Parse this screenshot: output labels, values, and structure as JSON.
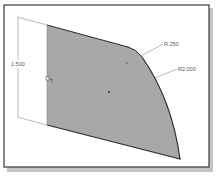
{
  "drawing": {
    "type": "CAD sketch",
    "dimensions": {
      "vertical_height": "1.500",
      "small_radius": "R.250",
      "large_radius": "R2.000"
    },
    "colors": {
      "background": "#ffffff",
      "frame": "#3a3a3a",
      "frame_shadow": "#b8b8b8",
      "region_fill": "#a8a8a8",
      "outline": "#2a2a2a",
      "dimension_line": "#777777",
      "dimension_text": "#555555"
    }
  }
}
